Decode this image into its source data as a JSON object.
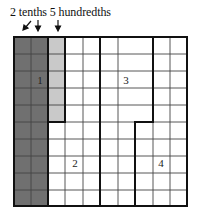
{
  "caption": "2 tenths 5 hundredths",
  "colors": {
    "tenths_fill": "#707070",
    "hundredths_fill": "#c9c9c9",
    "line": "#111111",
    "thin_line": "#555555"
  },
  "grid": {
    "columns": 10,
    "rows": 10,
    "shaded_tenths_columns": 2,
    "shaded_hundredths_cells": 5
  },
  "region_labels": [
    {
      "id": "1",
      "text": "1"
    },
    {
      "id": "2",
      "text": "2"
    },
    {
      "id": "3",
      "text": "3"
    },
    {
      "id": "4",
      "text": "4"
    }
  ]
}
